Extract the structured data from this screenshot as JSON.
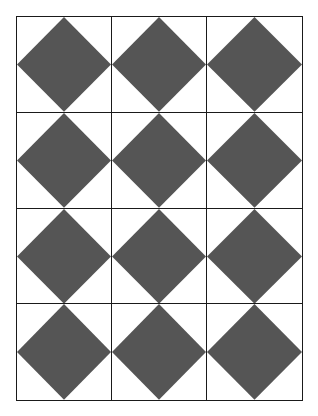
{
  "pattern": {
    "name": "diamond-tile-grid",
    "rows": 4,
    "columns": 3,
    "shape": "diamond",
    "colors": {
      "diamond_fill": "#555555",
      "cell_background": "#ffffff",
      "grid_line": "#1a1a1a"
    },
    "cells": [
      {
        "row": 1,
        "col": 1,
        "shape": "diamond"
      },
      {
        "row": 1,
        "col": 2,
        "shape": "diamond"
      },
      {
        "row": 1,
        "col": 3,
        "shape": "diamond"
      },
      {
        "row": 2,
        "col": 1,
        "shape": "diamond"
      },
      {
        "row": 2,
        "col": 2,
        "shape": "diamond"
      },
      {
        "row": 2,
        "col": 3,
        "shape": "diamond"
      },
      {
        "row": 3,
        "col": 1,
        "shape": "diamond"
      },
      {
        "row": 3,
        "col": 2,
        "shape": "diamond"
      },
      {
        "row": 3,
        "col": 3,
        "shape": "diamond"
      },
      {
        "row": 4,
        "col": 1,
        "shape": "diamond"
      },
      {
        "row": 4,
        "col": 2,
        "shape": "diamond"
      },
      {
        "row": 4,
        "col": 3,
        "shape": "diamond"
      }
    ]
  }
}
